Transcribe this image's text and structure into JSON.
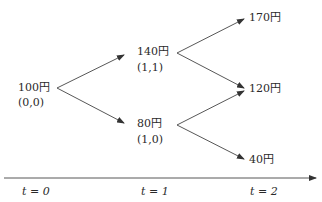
{
  "diagram": {
    "type": "binomial-tree",
    "nodes": [
      {
        "id": "n00",
        "price": "100円",
        "coord": "(0,0)"
      },
      {
        "id": "n11",
        "price": "140円",
        "coord": "(1,1)"
      },
      {
        "id": "n10",
        "price": "80円",
        "coord": "(1,0)"
      },
      {
        "id": "n22",
        "price": "170円"
      },
      {
        "id": "n21",
        "price": "120円"
      },
      {
        "id": "n20",
        "price": "40円"
      }
    ],
    "edges": [
      [
        "n00",
        "n11"
      ],
      [
        "n00",
        "n10"
      ],
      [
        "n11",
        "n22"
      ],
      [
        "n11",
        "n21"
      ],
      [
        "n10",
        "n21"
      ],
      [
        "n10",
        "n20"
      ]
    ],
    "time_axis": {
      "labels": [
        "t = 0",
        "t = 1",
        "t = 2"
      ]
    }
  }
}
